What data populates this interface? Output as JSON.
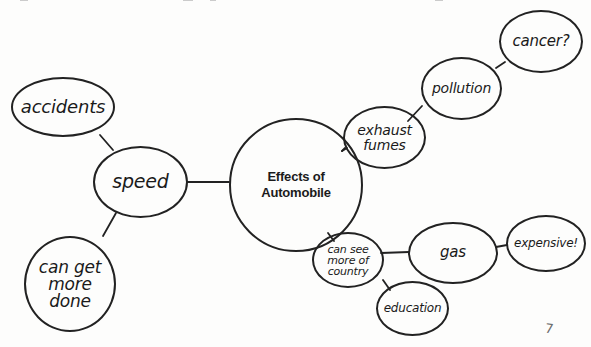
{
  "diagram": {
    "type": "concept-map",
    "central_topic": {
      "id": "center",
      "label": "Effects of\nAutomobile"
    },
    "nodes": [
      {
        "id": "center",
        "label": "Effects of\nAutomobile"
      },
      {
        "id": "speed",
        "label": "speed"
      },
      {
        "id": "accidents",
        "label": "accidents"
      },
      {
        "id": "can-get-more-done",
        "label": "can get\nmore\ndone"
      },
      {
        "id": "exhaust-fumes",
        "label": "exhaust\nfumes"
      },
      {
        "id": "pollution",
        "label": "pollution"
      },
      {
        "id": "cancer",
        "label": "cancer?"
      },
      {
        "id": "can-see-more-of-country",
        "label": "can see\nmore of\ncountry"
      },
      {
        "id": "gas",
        "label": "gas"
      },
      {
        "id": "expensive",
        "label": "expensive!"
      },
      {
        "id": "education",
        "label": "education"
      }
    ],
    "edges": [
      {
        "from": "center",
        "to": "speed"
      },
      {
        "from": "speed",
        "to": "accidents"
      },
      {
        "from": "speed",
        "to": "can-get-more-done"
      },
      {
        "from": "center",
        "to": "exhaust-fumes"
      },
      {
        "from": "exhaust-fumes",
        "to": "pollution"
      },
      {
        "from": "pollution",
        "to": "cancer"
      },
      {
        "from": "center",
        "to": "can-see-more-of-country"
      },
      {
        "from": "can-see-more-of-country",
        "to": "gas"
      },
      {
        "from": "gas",
        "to": "expensive"
      },
      {
        "from": "can-see-more-of-country",
        "to": "education"
      }
    ],
    "stray_mark": "7",
    "colors": {
      "stroke": "#222222",
      "text": "#1a1a1a",
      "background": "#fdfdfc"
    }
  }
}
